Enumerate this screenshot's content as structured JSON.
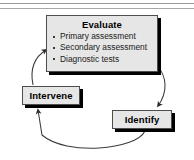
{
  "figure": {
    "name": "clinical-decision-cycle",
    "background_color": "#ffffff",
    "top_rules": 2
  },
  "nodes": {
    "evaluate": {
      "title": "Evaluate",
      "bullets": [
        "Primary assessment",
        "Secondary assessment",
        "Diagnostic tests"
      ]
    },
    "intervene": {
      "title": "Intervene"
    },
    "identify": {
      "title": "Identify"
    }
  },
  "arrows": [
    {
      "name": "arrow-evaluate-to-identify",
      "from": "Evaluate",
      "to": "Identify",
      "direction": "down-right"
    },
    {
      "name": "arrow-identify-to-intervene",
      "from": "Identify",
      "to": "Intervene",
      "direction": "bottom-arc-left"
    },
    {
      "name": "arrow-intervene-to-evaluate",
      "from": "Intervene",
      "to": "Evaluate",
      "direction": "up-right"
    }
  ],
  "colors": {
    "node_fill": "#e6e6e6",
    "node_border": "#4d4d4d",
    "shadow": "#000000",
    "arrow_stroke": "#333333",
    "rule": "#9a9a9a"
  }
}
